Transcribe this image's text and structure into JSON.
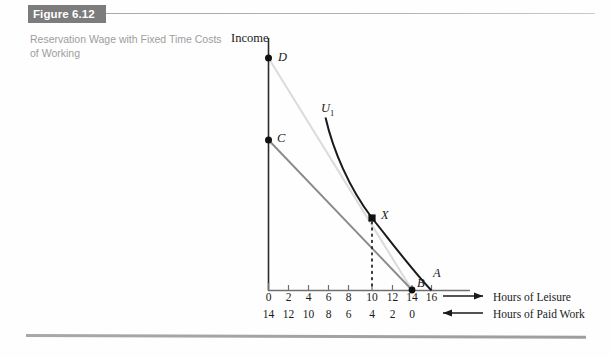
{
  "figure": {
    "banner_label": "Figure 6.12",
    "caption": "Reservation Wage with Fixed Time Costs of Working",
    "banner_color": "#7c7c7c",
    "caption_color": "#9d9d9d"
  },
  "chart_axes": {
    "y_axis_label": "Income",
    "x_axis_legend_leisure": "Hours of Leisure",
    "x_axis_legend_work": "Hours of Paid Work",
    "leisure_ticks": [
      "0",
      "2",
      "4",
      "6",
      "8",
      "10",
      "12",
      "14",
      "16"
    ],
    "work_ticks": [
      "14",
      "12",
      "10",
      "8",
      "6",
      "4",
      "2",
      "0"
    ]
  },
  "chart_labels": {
    "point_D": "D",
    "point_C": "C",
    "point_X": "X",
    "point_B": "B",
    "point_A": "A",
    "curve_U1": "U",
    "curve_U1_sub": "1"
  },
  "chart_data": {
    "type": "line",
    "title": "Reservation Wage with Fixed Time Costs of Working",
    "xlabel": "Hours of Leisure",
    "ylabel": "Income",
    "grid": false,
    "legend": "none",
    "xlim": [
      0,
      17.5
    ],
    "ylim": [
      0,
      18
    ],
    "x_secondary_label": "Hours of Paid Work",
    "x_ticks": [
      0,
      2,
      4,
      6,
      8,
      10,
      12,
      14,
      16
    ],
    "x_ticks_secondary": [
      14,
      12,
      10,
      8,
      6,
      4,
      2,
      0
    ],
    "annotations": [
      {
        "label": "D",
        "x": 0,
        "y": 16.5,
        "marker": "circle",
        "note": "full-income endowment with no fixed time cost"
      },
      {
        "label": "C",
        "x": 0,
        "y": 10.7,
        "marker": "circle",
        "note": "full income net of fixed time cost of working"
      },
      {
        "label": "X",
        "x": 10,
        "y": 5.1,
        "marker": "square",
        "note": "tangency of U1 with budget line"
      },
      {
        "label": "B",
        "x": 14,
        "y": 0,
        "marker": "circle",
        "note": "maximum leisure available when working"
      },
      {
        "label": "A",
        "x": 16,
        "y": 0,
        "marker": "none",
        "note": "total time endowment"
      }
    ],
    "series": [
      {
        "name": "Budget line D to B (no fixed time cost)",
        "color": "#dcdcdc",
        "style": "solid",
        "points": [
          [
            0,
            16.5
          ],
          [
            14,
            0
          ]
        ]
      },
      {
        "name": "Budget line C to B (with fixed time cost)",
        "color": "#8a8a8a",
        "style": "solid",
        "points": [
          [
            0,
            10.7
          ],
          [
            14,
            0
          ]
        ]
      },
      {
        "name": "U1 indifference curve",
        "color": "#1a1a1a",
        "style": "solid",
        "points": [
          [
            6.5,
            12.3
          ],
          [
            7.5,
            9.8
          ],
          [
            8.6,
            7.8
          ],
          [
            10,
            5.1
          ],
          [
            12,
            2.6
          ],
          [
            14,
            1.0
          ],
          [
            16,
            0
          ]
        ]
      },
      {
        "name": "Dotted reference line at X",
        "color": "#1a1a1a",
        "style": "dotted",
        "points": [
          [
            10,
            5.1
          ],
          [
            10,
            0
          ]
        ]
      }
    ]
  }
}
